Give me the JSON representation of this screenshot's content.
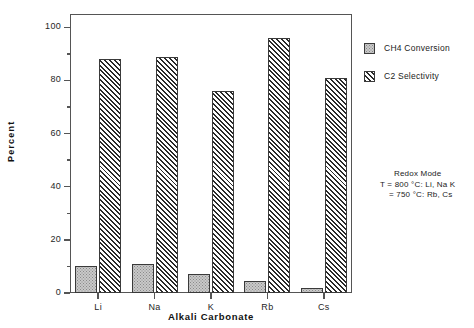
{
  "chart_data": {
    "type": "bar",
    "title": "",
    "xlabel": "Alkali  Carbonate",
    "ylabel": "Percent",
    "categories": [
      "Li",
      "Na",
      "K",
      "Rb",
      "Cs"
    ],
    "series": [
      {
        "name": "CH4 Conversion",
        "values": [
          10,
          11,
          7,
          4.5,
          2
        ],
        "fill": "dotted-gray",
        "color": "#c9c9c9"
      },
      {
        "name": "C2 Selectivity",
        "values": [
          88,
          89,
          76,
          96,
          81
        ],
        "fill": "diagonal-hatch",
        "color": "#2a2a2a"
      }
    ],
    "ylim": [
      0,
      105
    ],
    "yticks": [
      0,
      20,
      40,
      60,
      80,
      100
    ],
    "yticks_minor": [
      10,
      30,
      50,
      70,
      90
    ],
    "ytick_labels": [
      "0",
      "20",
      "40",
      "60",
      "80",
      "100"
    ],
    "grid": false,
    "legend_position": "right-top",
    "annotations": [
      "Redox Mode",
      "T = 800 °C: Li, Na K",
      "= 750 °C: Rb, Cs"
    ]
  },
  "legend": {
    "entries": [
      {
        "label": "CH4 Conversion",
        "swatch": "dotted-gray-swatch"
      },
      {
        "label": "C2 Selectivity",
        "swatch": "diagonal-hatch-swatch"
      }
    ]
  },
  "annotation": {
    "line1": "Redox Mode",
    "line2": "T = 800 °C: Li, Na K",
    "line3": "= 750 °C: Rb, Cs"
  },
  "axes": {
    "y_title": "Percent",
    "x_title": "Alkali  Carbonate"
  }
}
